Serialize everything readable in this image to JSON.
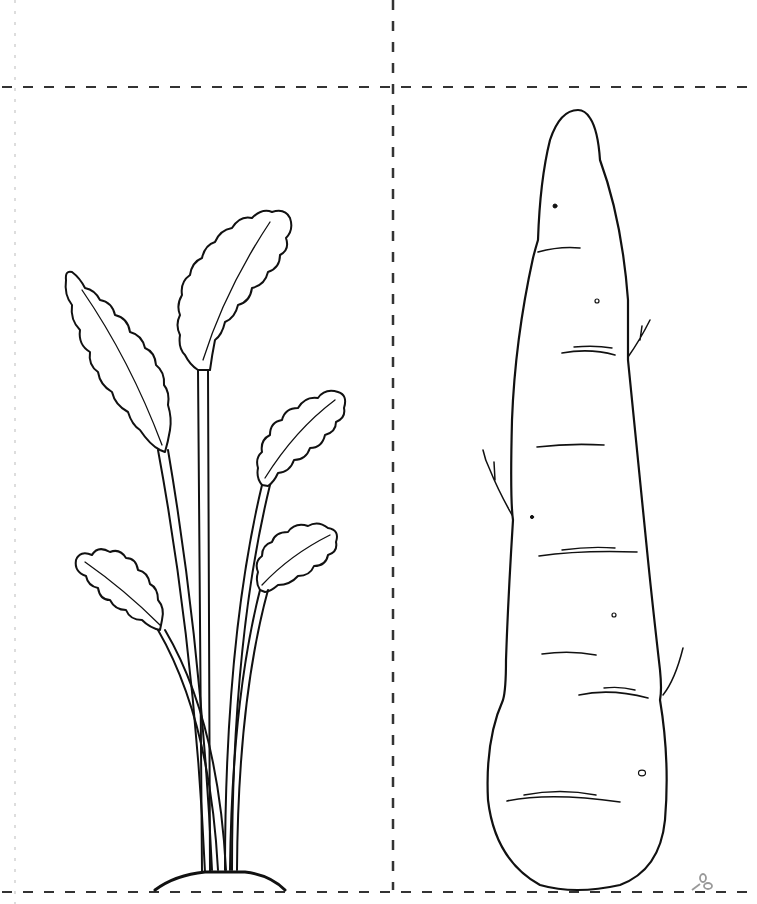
{
  "page": {
    "type": "coloring-page",
    "background": "#ffffff",
    "line_color": "#111111",
    "cut_line_color": "#333333",
    "faint_line_color": "#bbbbbb"
  },
  "panels": [
    {
      "id": "top-left",
      "content": "empty"
    },
    {
      "id": "top-right",
      "content": "empty"
    },
    {
      "id": "bottom-left",
      "content": "carrot-leaves"
    },
    {
      "id": "bottom-right",
      "content": "carrot-root"
    }
  ],
  "icons": {
    "scissors": "scissors-icon"
  }
}
